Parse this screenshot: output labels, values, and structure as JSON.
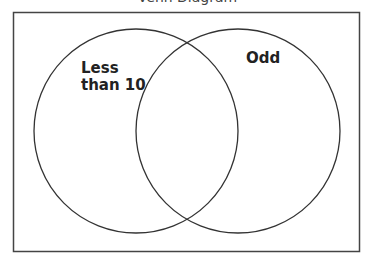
{
  "diagram": {
    "type": "venn",
    "title_partial": "Venn Diagram",
    "sets": [
      {
        "id": "left",
        "label_lines": [
          "Less",
          "than 10"
        ],
        "label": "Less than 10"
      },
      {
        "id": "right",
        "label_lines": [
          "Odd"
        ],
        "label": "Odd"
      }
    ],
    "colors": {
      "stroke": "#333333",
      "background": "#ffffff"
    }
  }
}
